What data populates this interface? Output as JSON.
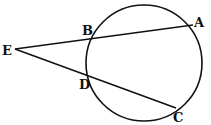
{
  "diagram": {
    "type": "geometry-secants",
    "circle": {
      "cx": 144,
      "cy": 63,
      "r": 58
    },
    "points": {
      "E": {
        "label": "E",
        "x": 15,
        "y": 49
      },
      "B": {
        "label": "B",
        "x": 90,
        "y": 38
      },
      "A": {
        "label": "A",
        "x": 193,
        "y": 25
      },
      "D": {
        "label": "D",
        "x": 89,
        "y": 76
      },
      "C": {
        "label": "C",
        "x": 176,
        "y": 108
      }
    },
    "segments": [
      [
        "E",
        "A"
      ],
      [
        "E",
        "C"
      ]
    ],
    "stroke_color": "#111111"
  }
}
